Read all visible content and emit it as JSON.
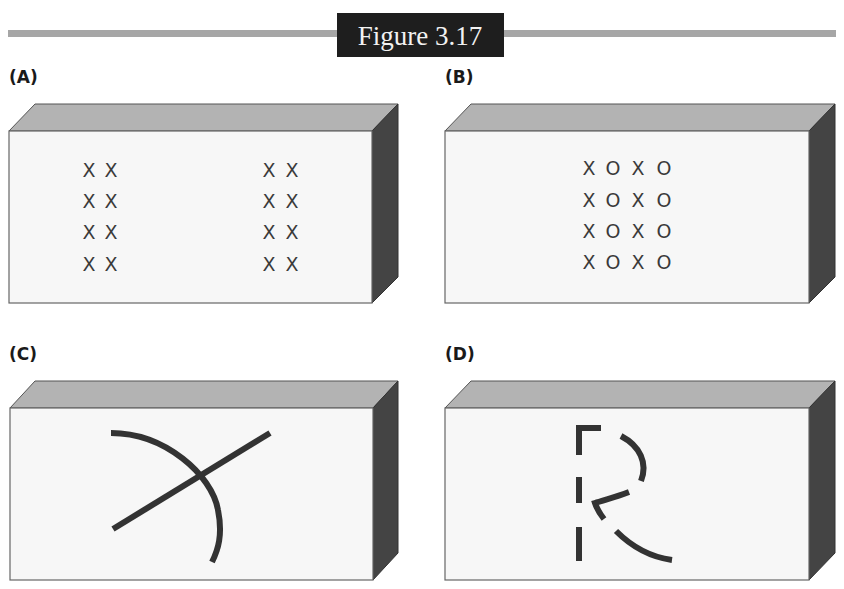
{
  "figure": {
    "title": "Figure 3.17",
    "colors": {
      "rule": "#a6a6a6",
      "title_bg": "#1e1e1e",
      "title_fg": "#f2f2f2",
      "front_face": "#f7f7f7",
      "top_face": "#b3b3b3",
      "side_face": "#444444",
      "ink": "#333333"
    }
  },
  "panels": [
    {
      "label": "(A)",
      "content": "two groups of X marks (2 columns × 4 rows each), widely separated",
      "rows": [
        [
          "X",
          "X",
          "X",
          "X"
        ],
        [
          "X",
          "X",
          "X",
          "X"
        ],
        [
          "X",
          "X",
          "X",
          "X"
        ],
        [
          "X",
          "X",
          "X",
          "X"
        ]
      ]
    },
    {
      "label": "(B)",
      "content": "grid of alternating X and O marks (4 columns × 4 rows)",
      "rows": [
        [
          "X",
          "O",
          "X",
          "O"
        ],
        [
          "X",
          "O",
          "X",
          "O"
        ],
        [
          "X",
          "O",
          "X",
          "O"
        ],
        [
          "X",
          "O",
          "X",
          "O"
        ]
      ]
    },
    {
      "label": "(C)",
      "content": "a straight line crossing a curved arc"
    },
    {
      "label": "(D)",
      "content": "fragmented line segments forming an incomplete letter R"
    }
  ]
}
